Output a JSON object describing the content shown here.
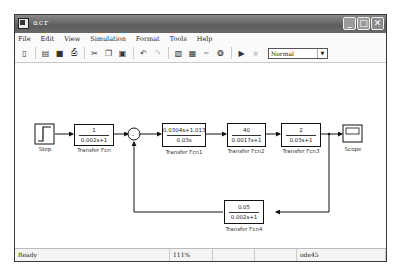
{
  "window": {
    "title": "acr",
    "buttons": [
      "minimize",
      "maximize",
      "close"
    ]
  },
  "menu": {
    "items": [
      {
        "u": "F",
        "rest": "ile"
      },
      {
        "u": "E",
        "rest": "dit"
      },
      {
        "u": "V",
        "rest": "iew"
      },
      {
        "u": "S",
        "rest": "imulation"
      },
      {
        "u": "",
        "pre": "F",
        "u2": "o",
        "rest": "rmat"
      },
      {
        "u": "T",
        "rest": "ools"
      },
      {
        "u": "H",
        "rest": "elp"
      }
    ],
    "labels": [
      "File",
      "Edit",
      "View",
      "Simulation",
      "Format",
      "Tools",
      "Help"
    ]
  },
  "toolbar": {
    "icons": [
      "new-icon",
      "open-icon",
      "save-icon",
      "print-icon",
      "cut-icon",
      "copy-icon",
      "paste-icon",
      "undo-icon",
      "redo-icon",
      "library-browser-icon",
      "model-explorer-icon",
      "debug-icon",
      "build-icon",
      "start-simulation-icon",
      "stop-simulation-icon"
    ],
    "glyphs": [
      "▯",
      "▤",
      "■",
      "⎙",
      "✂",
      "❐",
      "▣",
      "↶",
      "↷",
      "▧",
      "▦",
      "✒",
      "❂",
      "▶",
      "■"
    ],
    "sim_mode": "Normal"
  },
  "diagram": {
    "step": {
      "label": "Step"
    },
    "tf": {
      "num": "1",
      "den": "0.002s+1",
      "label": "Transfer Fcn"
    },
    "tf1": {
      "num": "0.0304s+1.013",
      "den": "0.03s",
      "label": "Transfer Fcn1"
    },
    "tf2": {
      "num": "40",
      "den": "0.0017s+1",
      "label": "Transfer Fcn2"
    },
    "tf3": {
      "num": "2",
      "den": "0.03s+1",
      "label": "Transfer Fcn3"
    },
    "tf4": {
      "num": "0.05",
      "den": "0.002s+1",
      "label": "Transfer Fcn4"
    },
    "scope": {
      "label": "Scope"
    },
    "sum": {
      "signs": "+-"
    }
  },
  "status": {
    "state": "Ready",
    "zoom": "111%",
    "cell3": "",
    "cell4": "",
    "solver": "ode45"
  }
}
